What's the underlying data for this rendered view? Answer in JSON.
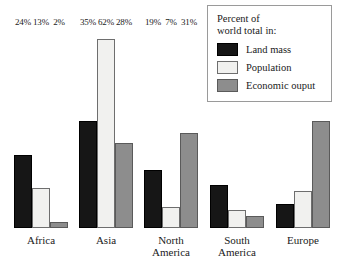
{
  "legend": {
    "title_line1": "Percent of",
    "title_line2": "world total in:",
    "entries": [
      {
        "label": "Land mass",
        "color": "#161616",
        "key": "land"
      },
      {
        "label": "Population",
        "color": "#f1f1ef",
        "key": "population"
      },
      {
        "label": "Economic ouput",
        "color": "#8d8d8d",
        "key": "economic"
      }
    ]
  },
  "axis": {
    "px_per_percent": 3.05,
    "baseline_offset_px": 49
  },
  "groups": [
    {
      "name": "Africa",
      "label_line1": "Africa",
      "label_line2": "",
      "left_px": 14,
      "bars": [
        {
          "series": "Land mass",
          "key": "land",
          "value": 24,
          "value_label": "24%"
        },
        {
          "series": "Population",
          "key": "population",
          "value": 13,
          "value_label": "13%"
        },
        {
          "series": "Economic ouput",
          "key": "economic",
          "value": 2,
          "value_label": "2%"
        }
      ]
    },
    {
      "name": "Asia",
      "label_line1": "Asia",
      "label_line2": "",
      "left_px": 79,
      "bars": [
        {
          "series": "Land mass",
          "key": "land",
          "value": 35,
          "value_label": "35%"
        },
        {
          "series": "Population",
          "key": "population",
          "value": 62,
          "value_label": "62%"
        },
        {
          "series": "Economic ouput",
          "key": "economic",
          "value": 28,
          "value_label": "28%"
        }
      ]
    },
    {
      "name": "North America",
      "label_line1": "North",
      "label_line2": "America",
      "left_px": 144,
      "bars": [
        {
          "series": "Land mass",
          "key": "land",
          "value": 19,
          "value_label": "19%"
        },
        {
          "series": "Population",
          "key": "population",
          "value": 7,
          "value_label": "7%"
        },
        {
          "series": "Economic ouput",
          "key": "economic",
          "value": 31,
          "value_label": "31%"
        }
      ]
    },
    {
      "name": "South America",
      "label_line1": "South",
      "label_line2": "America",
      "left_px": 210,
      "bars": [
        {
          "series": "Land mass",
          "key": "land",
          "value": 14,
          "value_label": "14%"
        },
        {
          "series": "Population",
          "key": "population",
          "value": 6,
          "value_label": "6%"
        },
        {
          "series": "Economic ouput",
          "key": "economic",
          "value": 4,
          "value_label": "4%"
        }
      ]
    },
    {
      "name": "Europe",
      "label_line1": "Europe",
      "label_line2": "",
      "left_px": 276,
      "bars": [
        {
          "series": "Land mass",
          "key": "land",
          "value": 8,
          "value_label": "8%"
        },
        {
          "series": "Population",
          "key": "population",
          "value": 12,
          "value_label": "12%"
        },
        {
          "series": "Economic ouput",
          "key": "economic",
          "value": 35,
          "value_label": "35%"
        }
      ]
    }
  ],
  "chart_data": {
    "type": "bar",
    "title": "",
    "subtitle": "",
    "xlabel": "",
    "ylabel": "",
    "unit": "%",
    "legend_title": "Percent of world total in:",
    "legend_position": "top-right",
    "grid": false,
    "axis_line": false,
    "ylim": [
      0,
      65
    ],
    "categories": [
      "Africa",
      "Asia",
      "North America",
      "South America",
      "Europe"
    ],
    "series": [
      {
        "name": "Land mass",
        "color": "#161616",
        "values": [
          24,
          35,
          19,
          14,
          8
        ]
      },
      {
        "name": "Population",
        "color": "#f1f1ef",
        "values": [
          13,
          62,
          7,
          6,
          12
        ]
      },
      {
        "name": "Economic ouput",
        "color": "#8d8d8d",
        "values": [
          2,
          28,
          31,
          4,
          35
        ]
      }
    ],
    "data_labels": [
      [
        "24%",
        "13%",
        "2%"
      ],
      [
        "35%",
        "62%",
        "28%"
      ],
      [
        "19%",
        "7%",
        "31%"
      ],
      [
        "14%",
        "6%",
        "4%"
      ],
      [
        "8%",
        "12%",
        "35%"
      ]
    ]
  }
}
